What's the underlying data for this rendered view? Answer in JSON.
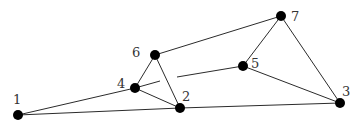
{
  "diagram": {
    "type": "undirected-graph",
    "node_radius": 5,
    "colors": {
      "node": "#000000",
      "edge": "#2b2b2b",
      "label": "#333333",
      "background": "#ffffff"
    },
    "nodes": [
      {
        "id": "1",
        "label": "1",
        "x": 18,
        "y": 115,
        "label_x": 13,
        "label_y": 104
      },
      {
        "id": "2",
        "label": "2",
        "x": 180,
        "y": 108,
        "label_x": 182,
        "label_y": 101
      },
      {
        "id": "3",
        "label": "3",
        "x": 340,
        "y": 103,
        "label_x": 342,
        "label_y": 96
      },
      {
        "id": "4",
        "label": "4",
        "x": 135,
        "y": 88,
        "label_x": 117,
        "label_y": 88
      },
      {
        "id": "5",
        "label": "5",
        "x": 243,
        "y": 66,
        "label_x": 251,
        "label_y": 68
      },
      {
        "id": "6",
        "label": "6",
        "x": 155,
        "y": 55,
        "label_x": 132,
        "label_y": 57
      },
      {
        "id": "7",
        "label": "7",
        "x": 281,
        "y": 16,
        "label_x": 291,
        "label_y": 21
      }
    ],
    "edges": [
      {
        "from": "1",
        "to": "4"
      },
      {
        "from": "1",
        "to": "2"
      },
      {
        "from": "4",
        "to": "6"
      },
      {
        "from": "4",
        "to": "2"
      },
      {
        "from": "6",
        "to": "2"
      },
      {
        "from": "6",
        "to": "7"
      },
      {
        "from": "7",
        "to": "5"
      },
      {
        "from": "7",
        "to": "3"
      },
      {
        "from": "5",
        "to": "3"
      },
      {
        "from": "2",
        "to": "3"
      },
      {
        "from": "4",
        "to": "5",
        "broken_at_crossing": "6-2",
        "segments": [
          [
            135,
            88,
            160,
            81
          ],
          [
            177,
            77,
            243,
            66
          ]
        ]
      }
    ]
  }
}
